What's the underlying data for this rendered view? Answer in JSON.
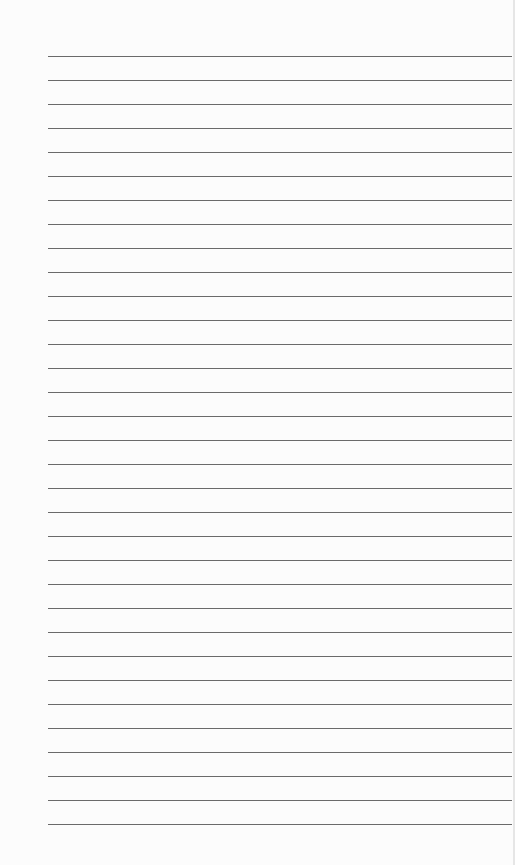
{
  "page": {
    "type": "lined-paper",
    "line_count": 33,
    "first_line_y": 56,
    "line_spacing": 24,
    "line_left": 48,
    "line_width": 464,
    "line_color": "#6a6a6a",
    "paper_color": "#fcfcfc"
  }
}
